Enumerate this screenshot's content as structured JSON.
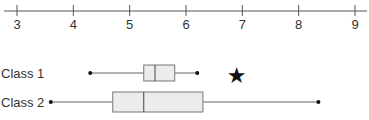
{
  "chart_data": {
    "type": "boxplot",
    "title": "",
    "xlabel": "",
    "ylabel": "",
    "xlim": [
      3,
      9
    ],
    "x_ticks": [
      3,
      4,
      5,
      6,
      7,
      8,
      9
    ],
    "x_tick_labels": [
      "3",
      "4",
      "5",
      "6",
      "7",
      "8",
      "9"
    ],
    "grid": false,
    "legend": null,
    "series": [
      {
        "name": "Class 1",
        "min": 4.3,
        "q1": 5.25,
        "median": 5.45,
        "q3": 5.8,
        "max": 6.2,
        "outliers": [
          6.9
        ]
      },
      {
        "name": "Class 2",
        "min": 3.6,
        "q1": 4.7,
        "median": 5.25,
        "q3": 6.3,
        "max": 8.35,
        "outliers": []
      }
    ]
  },
  "style": {
    "axis_color": "#555555",
    "box_fill": "#ececec",
    "box_stroke": "#777777",
    "whisker_color": "#666666",
    "text_color": "#333333"
  }
}
